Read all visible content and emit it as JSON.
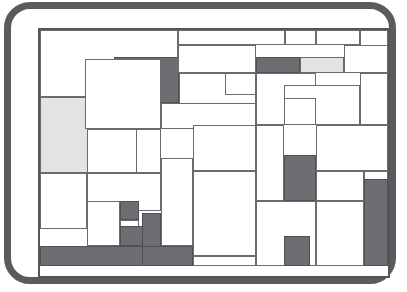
{
  "figure": {
    "type": "rectangle-packing",
    "canvas": {
      "x": 27,
      "y": 19,
      "width": 352,
      "height": 250
    },
    "frame": {
      "x": 4,
      "y": 2,
      "width": 392,
      "height": 282,
      "corner_radius": 26
    }
  },
  "colors": {
    "frame": "#5a5a5f",
    "background": "#ffffff",
    "rect_stroke": "#6b6b70",
    "boundary_stroke": "#55555a",
    "fill_dark": "#6d6d72",
    "fill_light": "#e3e3e3",
    "fill_white": "#ffffff"
  },
  "legend": {
    "dark_label": "dark",
    "light_label": "light",
    "white_label": "white"
  },
  "counts": {
    "total": 46,
    "dark": 12,
    "light": 3,
    "white": 31
  },
  "rects": [
    {
      "id": "boundary",
      "x": 0,
      "y": 0,
      "w": 352,
      "h": 250,
      "fill": "boundary"
    },
    {
      "id": "r01",
      "x": 2,
      "y": 2,
      "w": 138,
      "h": 67,
      "fill": "white"
    },
    {
      "id": "r02",
      "x": 140,
      "y": 2,
      "w": 107,
      "h": 15,
      "fill": "white"
    },
    {
      "id": "r03",
      "x": 247,
      "y": 2,
      "w": 31,
      "h": 15,
      "fill": "white"
    },
    {
      "id": "r04",
      "x": 278,
      "y": 2,
      "w": 44,
      "h": 15,
      "fill": "white"
    },
    {
      "id": "r05",
      "x": 322,
      "y": 2,
      "w": 28,
      "h": 28,
      "fill": "white"
    },
    {
      "id": "r06",
      "x": 76,
      "y": 29,
      "w": 65,
      "h": 16,
      "fill": "dark"
    },
    {
      "id": "r07",
      "x": 92,
      "y": 29,
      "w": 49,
      "h": 46,
      "fill": "dark"
    },
    {
      "id": "r08",
      "x": 140,
      "y": 17,
      "w": 78,
      "h": 28,
      "fill": "white"
    },
    {
      "id": "r09",
      "x": 218,
      "y": 29,
      "w": 44,
      "h": 16,
      "fill": "dark"
    },
    {
      "id": "r10",
      "x": 262,
      "y": 29,
      "w": 44,
      "h": 16,
      "fill": "light"
    },
    {
      "id": "r11",
      "x": 306,
      "y": 17,
      "w": 44,
      "h": 28,
      "fill": "white"
    },
    {
      "id": "r12",
      "x": 2,
      "y": 69,
      "w": 47,
      "h": 76,
      "fill": "light"
    },
    {
      "id": "r13",
      "x": 2,
      "y": 69,
      "w": 96,
      "h": 76,
      "fill": "light"
    },
    {
      "id": "r14",
      "x": 47,
      "y": 31,
      "w": 76,
      "h": 70,
      "fill": "white"
    },
    {
      "id": "r15",
      "x": 141,
      "y": 45,
      "w": 77,
      "h": 52,
      "fill": "white"
    },
    {
      "id": "r16",
      "x": 187,
      "y": 45,
      "w": 31,
      "h": 22,
      "fill": "white"
    },
    {
      "id": "r17",
      "x": 218,
      "y": 45,
      "w": 60,
      "h": 52,
      "fill": "white"
    },
    {
      "id": "r18",
      "x": 246,
      "y": 57,
      "w": 76,
      "h": 40,
      "fill": "white"
    },
    {
      "id": "r19",
      "x": 322,
      "y": 45,
      "w": 28,
      "h": 52,
      "fill": "white"
    },
    {
      "id": "r20",
      "x": 123,
      "y": 75,
      "w": 95,
      "h": 26,
      "fill": "white"
    },
    {
      "id": "r21",
      "x": 155,
      "y": 97,
      "w": 63,
      "h": 46,
      "fill": "white"
    },
    {
      "id": "r22",
      "x": 246,
      "y": 70,
      "w": 32,
      "h": 27,
      "fill": "white"
    },
    {
      "id": "r23",
      "x": 278,
      "y": 97,
      "w": 72,
      "h": 46,
      "fill": "white"
    },
    {
      "id": "r24",
      "x": 2,
      "y": 145,
      "w": 47,
      "h": 56,
      "fill": "white"
    },
    {
      "id": "r25",
      "x": 49,
      "y": 101,
      "w": 74,
      "h": 44,
      "fill": "white"
    },
    {
      "id": "r26",
      "x": 98,
      "y": 101,
      "w": 25,
      "h": 44,
      "fill": "white"
    },
    {
      "id": "r27",
      "x": 123,
      "y": 130,
      "w": 32,
      "h": 88,
      "fill": "white"
    },
    {
      "id": "r28",
      "x": 155,
      "y": 143,
      "w": 63,
      "h": 85,
      "fill": "white"
    },
    {
      "id": "r29",
      "x": 218,
      "y": 97,
      "w": 28,
      "h": 76,
      "fill": "white"
    },
    {
      "id": "r30",
      "x": 246,
      "y": 127,
      "w": 32,
      "h": 46,
      "fill": "dark"
    },
    {
      "id": "r31",
      "x": 278,
      "y": 143,
      "w": 48,
      "h": 30,
      "fill": "white"
    },
    {
      "id": "r32",
      "x": 326,
      "y": 143,
      "w": 24,
      "h": 30,
      "fill": "white"
    },
    {
      "id": "r33",
      "x": 49,
      "y": 145,
      "w": 74,
      "h": 38,
      "fill": "white"
    },
    {
      "id": "r34",
      "x": 49,
      "y": 173,
      "w": 33,
      "h": 45,
      "fill": "white"
    },
    {
      "id": "r35",
      "x": 82,
      "y": 173,
      "w": 19,
      "h": 19,
      "fill": "dark"
    },
    {
      "id": "r36",
      "x": 82,
      "y": 192,
      "w": 19,
      "h": 26,
      "fill": "white"
    },
    {
      "id": "r37",
      "x": 82,
      "y": 198,
      "w": 41,
      "h": 20,
      "fill": "dark"
    },
    {
      "id": "r38",
      "x": 104,
      "y": 185,
      "w": 19,
      "h": 43,
      "fill": "dark"
    },
    {
      "id": "r39",
      "x": 2,
      "y": 218,
      "w": 121,
      "h": 20,
      "fill": "dark"
    },
    {
      "id": "r40",
      "x": 104,
      "y": 218,
      "w": 51,
      "h": 20,
      "fill": "dark"
    },
    {
      "id": "r41",
      "x": 155,
      "y": 228,
      "w": 63,
      "h": 10,
      "fill": "white"
    },
    {
      "id": "r42",
      "x": 218,
      "y": 173,
      "w": 60,
      "h": 65,
      "fill": "white"
    },
    {
      "id": "r43",
      "x": 246,
      "y": 208,
      "w": 26,
      "h": 30,
      "fill": "dark"
    },
    {
      "id": "r44",
      "x": 278,
      "y": 173,
      "w": 48,
      "h": 65,
      "fill": "white"
    },
    {
      "id": "r45",
      "x": 326,
      "y": 151,
      "w": 24,
      "h": 87,
      "fill": "dark"
    }
  ]
}
